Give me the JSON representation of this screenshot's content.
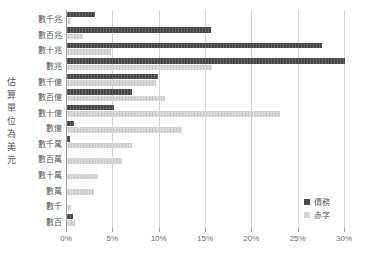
{
  "axis_title": "估算單位為美元",
  "chart_data": {
    "type": "bar",
    "orientation": "horizontal",
    "title": "",
    "xlabel": "",
    "ylabel": "估算單位為美元",
    "unit": "percent",
    "xlim": [
      0,
      30
    ],
    "x_ticks": [
      "0%",
      "5%",
      "10%",
      "15%",
      "20%",
      "25%",
      "30%"
    ],
    "grid": true,
    "legend_position": "right-bottom",
    "categories": [
      "數千兆",
      "數百兆",
      "數十兆",
      "數兆",
      "數千億",
      "數百億",
      "數十億",
      "數億",
      "數千萬",
      "數百萬",
      "數十萬",
      "數萬",
      "數千",
      "數百"
    ],
    "series": [
      {
        "name": "債務",
        "color": "#4a4a4a",
        "values": [
          3.0,
          15.5,
          27.5,
          30.0,
          9.8,
          7.0,
          5.1,
          0.8,
          0.3,
          0,
          0,
          0,
          0,
          0.7
        ]
      },
      {
        "name": "赤字",
        "color": "#d6d6d6",
        "values": [
          0.4,
          1.7,
          4.8,
          15.7,
          9.6,
          10.6,
          23.0,
          12.4,
          7.0,
          5.9,
          3.3,
          2.9,
          0.4,
          0.9
        ]
      }
    ]
  },
  "colors": {
    "background": "#ffffff",
    "gridline": "#d2d2d2",
    "axis_line": "#a6a6a6",
    "label_text": "#595959",
    "tick_text": "#737373"
  }
}
